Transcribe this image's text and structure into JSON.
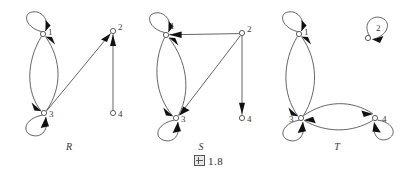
{
  "figure": {
    "caption_symbol": "图",
    "caption_number": "1.8",
    "caption_full": "图 1.8",
    "background_color": "#ffffff",
    "line_color": "#4a4a4a",
    "arrow_color": "#111111",
    "width": 417,
    "height": 180
  },
  "graphs": [
    {
      "name": "R",
      "caption": "R",
      "caption_x": 69,
      "caption_y": 150,
      "nodes": [
        {
          "id": "1",
          "label": "1",
          "x": 43,
          "y": 34,
          "r": 2.6,
          "label_dx": 5,
          "label_dy": 1
        },
        {
          "id": "2",
          "label": "2",
          "x": 113,
          "y": 31,
          "r": 2.6,
          "label_dx": 5,
          "label_dy": -1
        },
        {
          "id": "3",
          "label": "3",
          "x": 44,
          "y": 113,
          "r": 2.6,
          "label_dx": 5,
          "label_dy": 4
        },
        {
          "id": "4",
          "label": "4",
          "x": 113,
          "y": 113,
          "r": 2.6,
          "label_dx": 5,
          "label_dy": 4
        }
      ],
      "self_loops": [
        {
          "node": "1",
          "direction": "up-left",
          "cx": 32,
          "cy": 23,
          "r": 14
        },
        {
          "node": "3",
          "direction": "down-left",
          "cx": 33,
          "cy": 124,
          "r": 14
        }
      ],
      "edges": [
        {
          "from": "1",
          "to": "3",
          "type": "arc",
          "bow": "left"
        },
        {
          "from": "3",
          "to": "1",
          "type": "arc",
          "bow": "right"
        },
        {
          "from": "3",
          "to": "2",
          "type": "straight"
        },
        {
          "from": "4",
          "to": "2",
          "type": "straight"
        }
      ],
      "edge_list_text": "{(1,1),(1,3),(3,1),(3,3),(3,2),(4,2)}"
    },
    {
      "name": "S",
      "caption": "S",
      "caption_x": 201,
      "caption_y": 150,
      "nodes": [
        {
          "id": "1",
          "label": "1",
          "x": 166,
          "y": 35,
          "r": 2.6,
          "label_dx": 5,
          "label_dy": -4
        },
        {
          "id": "2",
          "label": "2",
          "x": 242,
          "y": 33,
          "r": 2.6,
          "label_dx": 5,
          "label_dy": -1
        },
        {
          "id": "3",
          "label": "3",
          "x": 176,
          "y": 118,
          "r": 2.6,
          "label_dx": 5,
          "label_dy": 4
        },
        {
          "id": "4",
          "label": "4",
          "x": 242,
          "y": 118,
          "r": 2.6,
          "label_dx": 5,
          "label_dy": 4
        }
      ],
      "self_loops": [
        {
          "node": "1",
          "direction": "up-left",
          "cx": 155,
          "cy": 24,
          "r": 14
        },
        {
          "node": "3",
          "direction": "down-left",
          "cx": 165,
          "cy": 129,
          "r": 14
        }
      ],
      "edges": [
        {
          "from": "1",
          "to": "3",
          "type": "arc",
          "bow": "left"
        },
        {
          "from": "3",
          "to": "1",
          "type": "arc",
          "bow": "right"
        },
        {
          "from": "2",
          "to": "1",
          "type": "straight"
        },
        {
          "from": "2",
          "to": "3",
          "type": "straight"
        },
        {
          "from": "2",
          "to": "4",
          "type": "straight"
        }
      ],
      "edge_list_text": "{(1,1),(1,3),(3,1),(3,3),(2,1),(2,3),(2,4)}"
    },
    {
      "name": "T",
      "caption": "T",
      "caption_x": 337,
      "caption_y": 150,
      "nodes": [
        {
          "id": "1",
          "label": "1",
          "x": 299,
          "y": 34,
          "r": 2.6,
          "label_dx": 5,
          "label_dy": 1
        },
        {
          "id": "2",
          "label": "2",
          "x": 368,
          "y": 38,
          "r": 2.6,
          "label_dx": 8,
          "label_dy": -5
        },
        {
          "id": "3",
          "label": "3",
          "x": 301,
          "y": 118,
          "r": 2.6,
          "label_dx": -12,
          "label_dy": 4
        },
        {
          "id": "4",
          "label": "4",
          "x": 375,
          "y": 118,
          "r": 2.6,
          "label_dx": 7,
          "label_dy": 4
        }
      ],
      "self_loops": [
        {
          "node": "1",
          "direction": "up-left",
          "cx": 288,
          "cy": 23,
          "r": 14
        },
        {
          "node": "2",
          "direction": "up-right",
          "cx": 379,
          "cy": 28,
          "r": 14
        },
        {
          "node": "3",
          "direction": "down-left",
          "cx": 290,
          "cy": 129,
          "r": 14
        },
        {
          "node": "4",
          "direction": "down-right",
          "cx": 386,
          "cy": 127,
          "r": 14
        }
      ],
      "edges": [
        {
          "from": "1",
          "to": "3",
          "type": "arc",
          "bow": "left"
        },
        {
          "from": "3",
          "to": "1",
          "type": "arc",
          "bow": "right"
        },
        {
          "from": "3",
          "to": "4",
          "type": "arc",
          "bow": "up"
        },
        {
          "from": "4",
          "to": "3",
          "type": "arc",
          "bow": "down"
        }
      ],
      "edge_list_text": "{(1,1),(2,2),(3,3),(4,4),(1,3),(3,1),(3,4),(4,3)}"
    }
  ]
}
